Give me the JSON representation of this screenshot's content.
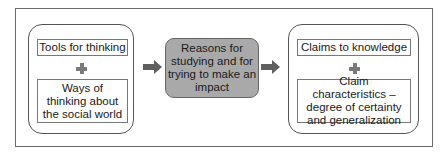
{
  "diagram": {
    "left_group": {
      "top_box": "Tools for thinking",
      "bottom_box": "Ways of thinking about the social world"
    },
    "center_box": "Reasons for studying and for trying to make an impact",
    "right_group": {
      "top_box": "Claims to knowledge",
      "bottom_box": "Claim characteristics – degree of certainty and generalization"
    },
    "colors": {
      "center_fill": "#a9a9a9",
      "arrow": "#5f5f5f",
      "plus": "#7a7a7a"
    }
  }
}
